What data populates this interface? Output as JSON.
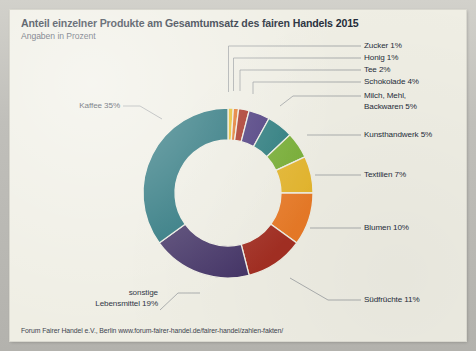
{
  "card": {
    "title": "Anteil einzelner Produkte am Gesamtumsatz des fairen Handels 2015",
    "subtitle": "Angaben in Prozent",
    "source": "Forum Fairer Handel e.V., Berlin www.forum-fairer-handel.de/fairer-handel/zahlen-fakten/",
    "background_color": "#efeee4",
    "frame_color": "#c3c2bd"
  },
  "chart_data": {
    "type": "pie",
    "variant": "donut",
    "title": "Anteil einzelner Produkte am Gesamtumsatz des fairen Handels 2015",
    "subtitle": "Angaben in Prozent",
    "unit": "%",
    "total": 100,
    "start_angle_deg": 0,
    "direction": "clockwise",
    "legend": "none",
    "grid": false,
    "labels": [
      "Zucker",
      "Honig",
      "Tee",
      "Schokolade",
      "Milch, Mehl, Backwaren",
      "Kunsthandwerk",
      "Textilien",
      "Blumen",
      "Südfrüchte",
      "sonstige Lebensmittel",
      "Kaffee"
    ],
    "values": [
      1,
      1,
      2,
      4,
      5,
      5,
      7,
      10,
      11,
      19,
      35
    ],
    "colors": [
      "#e8bf2e",
      "#e4782a",
      "#a83224",
      "#4b3a7e",
      "#2a7b7d",
      "#76ad33",
      "#e4b52c",
      "#e87a27",
      "#a32f23",
      "#453567",
      "#25727a"
    ],
    "slices": [
      {
        "label": "Zucker",
        "value": 1,
        "display": "Zucker 1%",
        "color": "#e8bf2e",
        "side": "right"
      },
      {
        "label": "Honig",
        "value": 1,
        "display": "Honig 1%",
        "color": "#e4782a",
        "side": "right"
      },
      {
        "label": "Tee",
        "value": 2,
        "display": "Tee 2%",
        "color": "#a83224",
        "side": "right"
      },
      {
        "label": "Schokolade",
        "value": 4,
        "display": "Schokolade 4%",
        "color": "#4b3a7e",
        "side": "right"
      },
      {
        "label": "Milch, Mehl, Backwaren",
        "value": 5,
        "display": "Milch, Mehl, Backwaren 5%",
        "color": "#2a7b7d",
        "side": "right"
      },
      {
        "label": "Kunsthandwerk",
        "value": 5,
        "display": "Kunsthandwerk 5%",
        "color": "#76ad33",
        "side": "right"
      },
      {
        "label": "Textilien",
        "value": 7,
        "display": "Textilien 7%",
        "color": "#e4b52c",
        "side": "right"
      },
      {
        "label": "Blumen",
        "value": 10,
        "display": "Blumen 10%",
        "color": "#e87a27",
        "side": "right"
      },
      {
        "label": "Südfrüchte",
        "value": 11,
        "display": "Südfrüchte 11%",
        "color": "#a32f23",
        "side": "right"
      },
      {
        "label": "sonstige Lebensmittel",
        "value": 19,
        "display": "sonstige Lebensmittel 19%",
        "color": "#453567",
        "side": "left"
      },
      {
        "label": "Kaffee",
        "value": 35,
        "display": "Kaffee 35%",
        "color": "#25727a",
        "side": "left"
      }
    ]
  },
  "callouts": {
    "zucker": {
      "name": "Zucker",
      "pct": "1%",
      "text": "Zucker 1%"
    },
    "honig": {
      "name": "Honig",
      "pct": "1%",
      "text": "Honig 1%"
    },
    "tee": {
      "name": "Tee",
      "pct": "2%",
      "text": "Tee 2%"
    },
    "schokolade": {
      "name": "Schokolade",
      "pct": "4%",
      "text": "Schokolade 4%"
    },
    "milch_line1": "Milch, Mehl,",
    "milch_line2": "Backwaren 5%",
    "kunsthandwerk": "Kunsthandwerk 5%",
    "textilien": "Textilien 7%",
    "blumen": "Blumen 10%",
    "suedfruechte": "Südfrüchte 11%",
    "kaffee": "Kaffee 35%",
    "sonstige_line1": "sonstige",
    "sonstige_line2": "Lebensmittel 19%"
  }
}
